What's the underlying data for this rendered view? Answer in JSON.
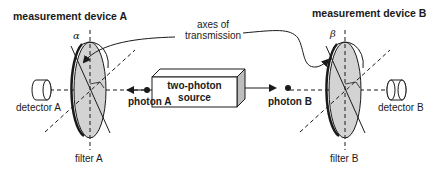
{
  "diagram": {
    "title_left": "measurement device A",
    "title_right": "measurement device B",
    "axes_label_line1": "axes of",
    "axes_label_line2": "transmission",
    "source_line1": "two-photon",
    "source_line2": "source",
    "photon_a": "photon A",
    "photon_b": "photon B",
    "detector_a": "detector A",
    "detector_b": "detector B",
    "filter_a": "filter A",
    "filter_b": "filter B",
    "angle_a": "α",
    "angle_b": "β",
    "colors": {
      "filter_fill": "#d3d3d3",
      "line": "#1a1a1a",
      "background": "#ffffff"
    }
  }
}
